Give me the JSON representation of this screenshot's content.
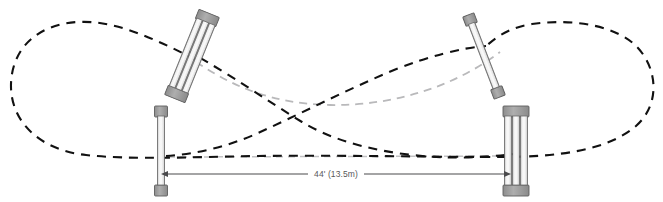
{
  "diagram": {
    "background_color": "#ffffff",
    "width": 663,
    "height": 202,
    "dimension": {
      "label": "44' (13.5m)",
      "feet": 44,
      "meters": 13.5,
      "from": "bottom-left-standard",
      "to": "bottom-right-standard",
      "line_color": "#4a4a4c",
      "text_color": "#58585a"
    },
    "paths": [
      {
        "name": "outer-track-loop",
        "style": "dashed",
        "color": "#111111",
        "dash": "9,7",
        "width": 2.1,
        "description": "Outer dashed oval track enclosing the whole course"
      },
      {
        "name": "crossing-approach-line-left",
        "style": "dashed",
        "color": "#111111",
        "dash": "9,7",
        "width": 2.1,
        "description": "Dashed approach curve from top-left standard crossing to bottom-right standard"
      },
      {
        "name": "crossing-approach-line-right",
        "style": "dashed",
        "color": "#111111",
        "dash": "9,7",
        "width": 2.1,
        "description": "Dashed approach curve from bottom-left standard crossing to top-right standard"
      },
      {
        "name": "secondary-approach-line",
        "style": "dashed",
        "color": "#b9b9bb",
        "dash": "8,6",
        "width": 1.7,
        "description": "Light grey dashed alternate approach curve"
      },
      {
        "name": "baseline-reference-line",
        "style": "dashed",
        "color": "#c2c2c4",
        "dash": "7,5",
        "width": 1.4,
        "description": "Light grey dashed horizontal baseline between the two bottom standards"
      }
    ],
    "obstacles": [
      {
        "name": "top-left-standard",
        "type": "double-pole",
        "poles": 3,
        "rotation_deg": 22,
        "center_x": 192,
        "center_y": 56,
        "length": 92,
        "width": 18,
        "pole_color": "#f1f1f1",
        "cap_color": "#a0a0a0",
        "outline_color": "#5d5d5d"
      },
      {
        "name": "top-right-standard",
        "type": "single-pole",
        "poles": 1,
        "rotation_deg": -21,
        "center_x": 484,
        "center_y": 56,
        "length": 86,
        "width": 8,
        "pole_color": "#f1f1f1",
        "cap_color": "#a0a0a0",
        "outline_color": "#5d5d5d"
      },
      {
        "name": "bottom-left-standard",
        "type": "single-pole",
        "poles": 1,
        "rotation_deg": 0,
        "center_x": 161,
        "center_y": 151,
        "length": 88,
        "width": 8,
        "pole_color": "#f1f1f1",
        "cap_color": "#a0a0a0",
        "outline_color": "#5d5d5d"
      },
      {
        "name": "bottom-right-standard",
        "type": "double-pole",
        "poles": 3,
        "rotation_deg": 0,
        "center_x": 516,
        "center_y": 151,
        "length": 88,
        "width": 22,
        "pole_color": "#f1f1f1",
        "cap_color": "#a0a0a0",
        "outline_color": "#5d5d5d"
      }
    ]
  }
}
